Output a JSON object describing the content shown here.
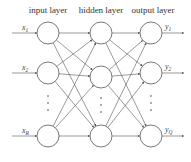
{
  "diagram": {
    "type": "feedforward-neural-network",
    "layers": [
      {
        "name": "input layer",
        "x": 48,
        "nodes": [
          {
            "y": 33,
            "label": "x",
            "sub": "1"
          },
          {
            "y": 73,
            "label": "x",
            "sub": "2"
          },
          {
            "y": 136,
            "label": "x",
            "sub": "R"
          }
        ],
        "ellipsis_y": [
          96,
          103,
          110
        ]
      },
      {
        "name": "hidden layer",
        "x": 101,
        "nodes": [
          {
            "y": 33
          },
          {
            "y": 77
          },
          {
            "y": 136
          }
        ],
        "ellipsis_y": [
          98,
          105,
          112
        ]
      },
      {
        "name": "output layer",
        "x": 151,
        "nodes": [
          {
            "y": 33,
            "label": "y",
            "sub": "1"
          },
          {
            "y": 73,
            "label": "y",
            "sub": "2"
          },
          {
            "y": 136,
            "label": "y",
            "sub": "Q"
          }
        ],
        "ellipsis_y": [
          96,
          103,
          110
        ]
      }
    ],
    "node_radius": 11,
    "header_y": 12,
    "input_arrow_start_x": 12,
    "output_arrow_end_x": 184,
    "stroke_color": "#555555",
    "text_color": "#333333"
  },
  "labels": {
    "input_header": "input layer",
    "hidden_header": "hidden layer",
    "output_header": "output layer"
  }
}
